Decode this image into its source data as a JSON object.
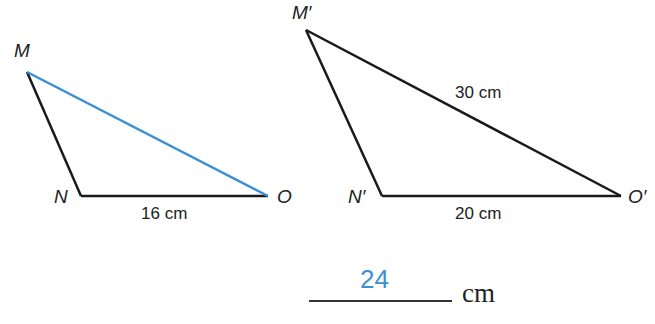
{
  "triangle1": {
    "vertices": {
      "M": "M",
      "N": "N",
      "O": "O"
    },
    "side_NO": "16 cm",
    "highlighted_side": "MO",
    "highlight_color": "#3a8fd6"
  },
  "triangle2": {
    "vertices": {
      "M": "M′",
      "N": "N′",
      "O": "O′"
    },
    "side_MO": "30 cm",
    "side_NO": "20 cm"
  },
  "answer": {
    "value": "24",
    "unit": "cm",
    "color": "#3a8fd6"
  }
}
